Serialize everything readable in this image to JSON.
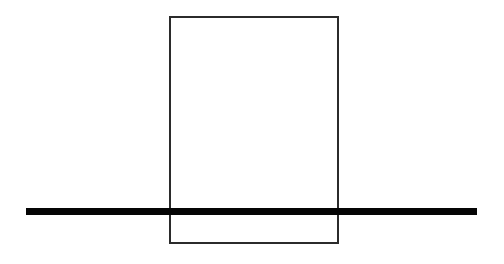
{
  "figure": {
    "title": "",
    "background_color": "#ffffff",
    "canvas": {
      "width": 504,
      "height": 264
    }
  },
  "chart_data": {
    "type": "diagram",
    "title": "",
    "subtitle": "",
    "xlabel": "",
    "ylabel": "",
    "grid": false,
    "legend": null,
    "annotations": [],
    "tick_labels": [],
    "axis_ranges": {
      "x": [
        0,
        504
      ],
      "y": [
        0,
        264
      ]
    },
    "shapes": [
      {
        "name": "rectangle-outline",
        "kind": "rectangle",
        "x": 170,
        "y": 17,
        "width": 168,
        "height": 226,
        "stroke_color": "#2b2b2b",
        "stroke_width": 1.6,
        "fill": "none",
        "left_edge_x": 170,
        "right_edge_x": 338,
        "top_edge_y": 17,
        "bottom_edge_y": 243
      },
      {
        "name": "horizontal-thick-bar",
        "kind": "bar",
        "x": 26,
        "y": 208,
        "width": 451,
        "height": 7,
        "stroke_color": "#000000",
        "fill": "#050505",
        "start_x": 26,
        "end_x": 477,
        "center_y": 211.5,
        "thickness": 7
      }
    ]
  }
}
